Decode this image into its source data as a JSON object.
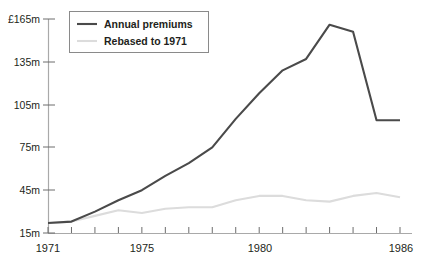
{
  "chart_data": {
    "type": "line",
    "title": "",
    "xlabel": "",
    "ylabel": "",
    "x": [
      1971,
      1972,
      1973,
      1974,
      1975,
      1976,
      1977,
      1978,
      1979,
      1980,
      1981,
      1982,
      1983,
      1984,
      1985,
      1986
    ],
    "xlim": [
      1971,
      1986
    ],
    "ylim": [
      15,
      165
    ],
    "yticks": [
      15,
      45,
      75,
      105,
      135,
      165
    ],
    "ytick_labels": [
      "15m",
      "45m",
      "75m",
      "105m",
      "135m",
      "£165m"
    ],
    "xtick_labels": [
      "1971",
      "1975",
      "1980",
      "1986"
    ],
    "xtick_values": [
      1971,
      1975,
      1980,
      1986
    ],
    "grid": false,
    "legend_position": "top-left",
    "units": "£m",
    "series": [
      {
        "name": "Annual premiums",
        "color": "#4a4a4a",
        "values": [
          22,
          23,
          30,
          38,
          45,
          55,
          64,
          75,
          95,
          113,
          129,
          137,
          161,
          156,
          94,
          94
        ]
      },
      {
        "name": "Rebased to 1971",
        "color": "#dcdcdc",
        "values": [
          22,
          23,
          27,
          31,
          29,
          32,
          33,
          33,
          38,
          41,
          41,
          38,
          37,
          41,
          43,
          40
        ]
      }
    ]
  },
  "legend": {
    "items": [
      {
        "label": "Annual premiums",
        "swatch": "line-swatch-dark"
      },
      {
        "label": "Rebased to 1971",
        "swatch": "line-swatch-light"
      }
    ]
  },
  "axes": {
    "y": {
      "t165": "£165m",
      "t135": "135m",
      "t105": "105m",
      "t75": "75m",
      "t45": "45m",
      "t15": "15m"
    },
    "x": {
      "t1971": "1971",
      "t1975": "1975",
      "t1980": "1980",
      "t1986": "1986"
    }
  },
  "footnote": {
    "text": ""
  }
}
